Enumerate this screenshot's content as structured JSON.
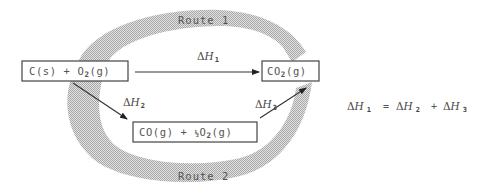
{
  "diagram": {
    "type": "hess-cycle",
    "routes": {
      "route1_label": "Route 1",
      "route2_label": "Route 2"
    },
    "species": {
      "reactants": {
        "parts": [
          "C(s) + O",
          "2",
          "(g)"
        ]
      },
      "product": {
        "parts": [
          "CO",
          "2",
          "(g)"
        ]
      },
      "intermediate": {
        "parts": [
          "CO(g) + ",
          "½",
          "O",
          "2",
          "(g)"
        ]
      }
    },
    "enthalpies": {
      "dh1": {
        "delta": "Δ",
        "h": "H",
        "sub": "1"
      },
      "dh2": {
        "delta": "Δ",
        "h": "H",
        "sub": "2"
      },
      "dh3": {
        "delta": "Δ",
        "h": "H",
        "sub": "3"
      }
    },
    "equation": {
      "lhs": {
        "delta": "Δ",
        "h": "H",
        "sub": "1"
      },
      "equals": "=",
      "term1": {
        "delta": "Δ",
        "h": "H",
        "sub": "2"
      },
      "plus": "+",
      "term2": {
        "delta": "Δ",
        "h": "H",
        "sub": "3"
      }
    },
    "colors": {
      "ring_fill": "#c8c8c8",
      "box_stroke": "#444444",
      "text": "#555555",
      "arrow": "#333333"
    }
  }
}
